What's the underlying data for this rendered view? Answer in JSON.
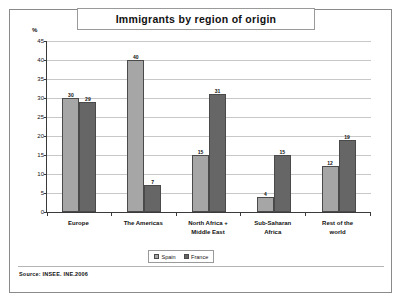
{
  "figure": {
    "title": "Immigrants by region of origin",
    "source": "Source:  INSEE. INE.2006"
  },
  "chart_data": {
    "type": "bar",
    "title": "Immigrants by region of origin",
    "xlabel": "",
    "ylabel": "%",
    "ylim": [
      0,
      45
    ],
    "yticks": [
      0,
      5,
      10,
      15,
      20,
      25,
      30,
      35,
      40,
      45
    ],
    "grid": true,
    "legend_position": "bottom",
    "categories": [
      "Europe",
      "The Americas",
      "North Africa + Middle East",
      "Sub-Saharan Africa",
      "Rest of the world"
    ],
    "category_lines": [
      [
        "Europe"
      ],
      [
        "The Americas"
      ],
      [
        "North Africa +",
        "Middle East"
      ],
      [
        "Sub-Saharan",
        "Africa"
      ],
      [
        "Rest of the",
        "world"
      ]
    ],
    "series": [
      {
        "name": "Spain",
        "color": "#a6a6a6",
        "values": [
          30,
          40,
          15,
          4,
          12
        ]
      },
      {
        "name": "France",
        "color": "#666666",
        "values": [
          29,
          7,
          31,
          15,
          19
        ]
      }
    ]
  }
}
